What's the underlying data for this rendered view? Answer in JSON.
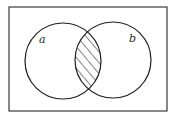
{
  "diagram": {
    "type": "venn",
    "frame": {
      "x": 9,
      "y": 7,
      "width": 158,
      "height": 104,
      "stroke": "#3a3a3a"
    },
    "sets": [
      {
        "id": "a",
        "label": "a",
        "cx": 63,
        "cy": 61,
        "r": 38,
        "label_x": 39,
        "label_y": 43
      },
      {
        "id": "b",
        "label": "b",
        "cx": 113,
        "cy": 60,
        "r": 38,
        "label_x": 129,
        "label_y": 42
      }
    ],
    "shaded_region": "a ∩ b",
    "shading": "diagonal-hatch",
    "colors": {
      "line": "#1e1e1e",
      "background": "#ffffff"
    }
  }
}
